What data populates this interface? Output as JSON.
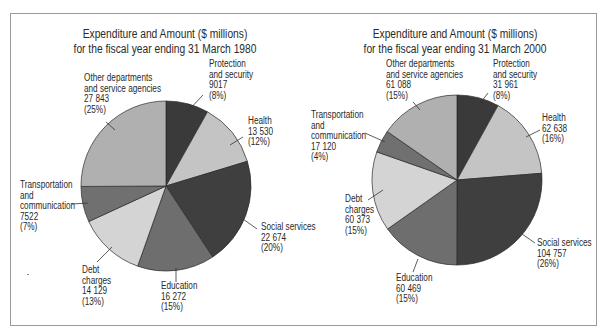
{
  "chart_data": [
    {
      "type": "pie",
      "title": "Expenditure and Amount ($ millions)",
      "subtitle": "for the fiscal year ending 31 March 1980",
      "unit": "$ millions",
      "categories": [
        "Protection and security",
        "Health",
        "Social services",
        "Education",
        "Debt charges",
        "Transportation and communication",
        "Other departments and service agencies"
      ],
      "values": [
        9017,
        13530,
        22674,
        16272,
        14129,
        7522,
        27843
      ],
      "percent": [
        8,
        12,
        20,
        15,
        13,
        7,
        25
      ],
      "value_labels": [
        "9017",
        "13 530",
        "22 674",
        "16 272",
        "14 129",
        "7522",
        "27 843"
      ],
      "percent_labels": [
        "(8%)",
        "(12%)",
        "(20%)",
        "(15%)",
        "(13%)",
        "(7%)",
        "(25%)"
      ],
      "colors": [
        "#3a3a3a",
        "#c4c4c4",
        "#3f3f3f",
        "#6e6e6e",
        "#d4d4d4",
        "#707070",
        "#b0b0b0"
      ],
      "start_angle_deg": 0,
      "direction": "clockwise",
      "legend": "none (direct labels)"
    },
    {
      "type": "pie",
      "title": "Expenditure and Amount ($ millions)",
      "subtitle": "for the fiscal year ending 31 March 2000",
      "unit": "$ millions",
      "categories": [
        "Protection and security",
        "Health",
        "Social services",
        "Education",
        "Debt charges",
        "Transportation and communication",
        "Other departments and service agencies"
      ],
      "values": [
        31961,
        62638,
        104757,
        60469,
        60373,
        17120,
        61088
      ],
      "percent": [
        8,
        16,
        26,
        15,
        15,
        4,
        15
      ],
      "value_labels": [
        "31 961",
        "62 638",
        "104 757",
        "60 469",
        "60 373",
        "17 120",
        "61 088"
      ],
      "percent_labels": [
        "(8%)",
        "(16%)",
        "(26%)",
        "(15%)",
        "(15%)",
        "(4%)",
        "(15%)"
      ],
      "colors": [
        "#3a3a3a",
        "#c4c4c4",
        "#3f3f3f",
        "#6e6e6e",
        "#d4d4d4",
        "#707070",
        "#b0b0b0"
      ],
      "start_angle_deg": 0,
      "direction": "clockwise",
      "legend": "none (direct labels)"
    }
  ],
  "charts": [
    {
      "title_line1": "Expenditure and Amount ($ millions)",
      "title_line2": "for the fiscal year ending 31 March 1980",
      "labels": {
        "protection": [
          "Protection",
          "and security",
          "9017",
          "(8%)"
        ],
        "health": [
          "Health",
          "13 530",
          "(12%)"
        ],
        "social": [
          "Social services",
          "22 674",
          "(20%)"
        ],
        "education": [
          "Education",
          "16 272",
          "(15%)"
        ],
        "debt": [
          "Debt",
          "charges",
          "14 129",
          "(13%)"
        ],
        "transport": [
          "Transportation",
          "and",
          "communication",
          "7522",
          "(7%)"
        ],
        "other": [
          "Other departments",
          "and service agencies",
          "27 843",
          "(25%)"
        ]
      }
    },
    {
      "title_line1": "Expenditure and Amount ($ millions)",
      "title_line2": "for the fiscal year ending 31 March 2000",
      "labels": {
        "protection": [
          "Protection",
          "and security",
          "31 961",
          "(8%)"
        ],
        "health": [
          "Health",
          "62 638",
          "(16%)"
        ],
        "social": [
          "Social services",
          "104 757",
          "(26%)"
        ],
        "education": [
          "Education",
          "60 469",
          "(15%)"
        ],
        "debt": [
          "Debt",
          "charges",
          "60 373",
          "(15%)"
        ],
        "transport": [
          "Transportation",
          "and",
          "communication",
          "17 120",
          "(4%)"
        ],
        "other": [
          "Other departments",
          "and service agencies",
          "61 088",
          "(15%)"
        ]
      }
    }
  ]
}
